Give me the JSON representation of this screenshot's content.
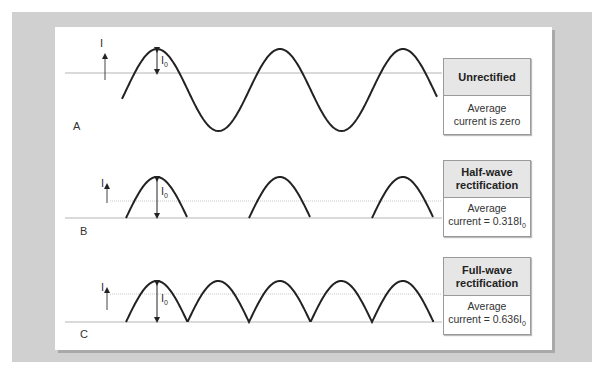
{
  "panels": [
    {
      "letter": "A",
      "kind": "unrectified",
      "title": "Unrectified",
      "desc_line1": "Average",
      "desc_line2": "current is zero",
      "desc_sub": ""
    },
    {
      "letter": "B",
      "kind": "half-wave",
      "title_line1": "Half-wave",
      "title_line2": "rectification",
      "desc_line1": "Average",
      "desc_line2": "current = 0.318I",
      "desc_sub": "0",
      "average_fraction": 0.318
    },
    {
      "letter": "C",
      "kind": "full-wave",
      "title_line1": "Full-wave",
      "title_line2": "rectification",
      "desc_line1": "Average",
      "desc_line2": "current = 0.636I",
      "desc_sub": "0",
      "average_fraction": 0.636
    }
  ],
  "axis_label": "I",
  "peak_label": "I",
  "peak_sub": "0",
  "colors": {
    "curve": "#222222",
    "axis": "#b5b5b5",
    "frame": "#d0d0d0"
  }
}
